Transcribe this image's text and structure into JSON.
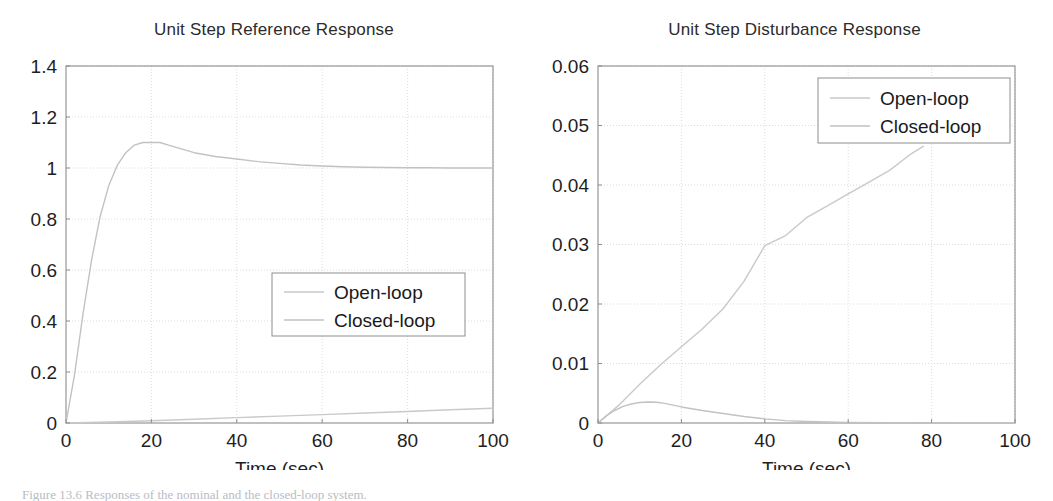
{
  "figure": {
    "caption": "Figure 13.6  Responses of the nominal and the closed-loop system."
  },
  "panels": [
    {
      "id": "reference",
      "title": "Unit Step Reference Response",
      "xlabel": "Time (sec)",
      "xticks": [
        "0",
        "20",
        "40",
        "60",
        "80",
        "100"
      ],
      "yticks": [
        "0",
        "0.2",
        "0.4",
        "0.6",
        "0.8",
        "1",
        "1.2",
        "1.4"
      ],
      "legend": {
        "items": [
          "Open-loop",
          "Closed-loop"
        ]
      }
    },
    {
      "id": "disturbance",
      "title": "Unit Step Disturbance Response",
      "xlabel": "Time (sec)",
      "xticks": [
        "0",
        "20",
        "40",
        "60",
        "80",
        "100"
      ],
      "yticks": [
        "0",
        "0.01",
        "0.02",
        "0.03",
        "0.04",
        "0.05",
        "0.06"
      ],
      "legend": {
        "items": [
          "Open-loop",
          "Closed-loop"
        ]
      }
    }
  ],
  "colors": {
    "axis": "#8d8d8d",
    "grid": "#d8d8d8",
    "curve_open": "#c9c9c9",
    "curve_closed": "#c2c2c2",
    "text": "#1e1e1e"
  },
  "chart_data": [
    {
      "type": "line",
      "title": "Unit Step Reference Response",
      "xlabel": "Time (sec)",
      "ylabel": "",
      "xlim": [
        0,
        100
      ],
      "ylim": [
        0,
        1.4
      ],
      "xticks": [
        0,
        20,
        40,
        60,
        80,
        100
      ],
      "yticks": [
        0,
        0.2,
        0.4,
        0.6,
        0.8,
        1,
        1.2,
        1.4
      ],
      "grid": true,
      "legend_position": "center-right",
      "series": [
        {
          "name": "Closed-loop",
          "x": [
            0,
            2,
            4,
            6,
            8,
            10,
            12,
            14,
            16,
            18,
            20,
            22,
            24,
            26,
            28,
            30,
            35,
            40,
            45,
            50,
            55,
            60,
            65,
            70,
            75,
            80,
            85,
            90,
            95,
            100
          ],
          "y": [
            0,
            0.19,
            0.43,
            0.64,
            0.81,
            0.93,
            1.01,
            1.06,
            1.09,
            1.1,
            1.1,
            1.1,
            1.09,
            1.08,
            1.07,
            1.06,
            1.045,
            1.035,
            1.025,
            1.018,
            1.012,
            1.008,
            1.005,
            1.003,
            1.002,
            1.001,
            1.001,
            1.0,
            1.0,
            1.0
          ]
        },
        {
          "name": "Open-loop",
          "x": [
            0,
            10,
            20,
            30,
            40,
            50,
            60,
            70,
            80,
            90,
            100
          ],
          "y": [
            0,
            0.004,
            0.009,
            0.015,
            0.021,
            0.027,
            0.033,
            0.039,
            0.045,
            0.052,
            0.058
          ]
        }
      ]
    },
    {
      "type": "line",
      "title": "Unit Step Disturbance Response",
      "xlabel": "Time (sec)",
      "ylabel": "",
      "xlim": [
        0,
        100
      ],
      "ylim": [
        0,
        0.06
      ],
      "xticks": [
        0,
        20,
        40,
        60,
        80,
        100
      ],
      "yticks": [
        0,
        0.01,
        0.02,
        0.03,
        0.04,
        0.05,
        0.06
      ],
      "grid": true,
      "legend_position": "top-right",
      "series": [
        {
          "name": "Open-loop",
          "x": [
            0,
            5,
            10,
            15,
            20,
            25,
            30,
            35,
            40,
            45,
            50,
            55,
            60,
            65,
            70,
            75,
            78
          ],
          "y": [
            0,
            0.003,
            0.0065,
            0.0098,
            0.0128,
            0.0158,
            0.0192,
            0.0238,
            0.0298,
            0.0315,
            0.0345,
            0.0365,
            0.0385,
            0.0405,
            0.0425,
            0.0452,
            0.0465
          ]
        },
        {
          "name": "Closed-loop",
          "x": [
            0,
            2,
            4,
            6,
            8,
            10,
            12,
            14,
            16,
            18,
            20,
            25,
            30,
            35,
            40,
            45,
            50,
            60,
            70,
            80,
            90,
            100
          ],
          "y": [
            0,
            0.0012,
            0.0021,
            0.0028,
            0.0032,
            0.00345,
            0.00352,
            0.00348,
            0.0033,
            0.003,
            0.0027,
            0.0021,
            0.0016,
            0.0011,
            0.0007,
            0.0004,
            0.00025,
            0.0001,
            5e-05,
            2e-05,
            1e-05,
            0.0
          ]
        }
      ]
    }
  ]
}
